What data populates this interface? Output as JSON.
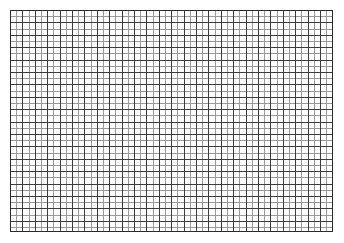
{
  "page": {
    "width": 344,
    "height": 243,
    "background_color": "#ffffff"
  },
  "graph_paper": {
    "name": "graph-paper-grid",
    "description": "Blank square-ruled graph paper sheet",
    "left": 10,
    "top": 10,
    "width": 323,
    "height": 222,
    "paper_color": "#ffffff",
    "minor_line_color": "#9a9a9a",
    "major_line_color": "#3c3c3c",
    "border_color": "#2b2b2b",
    "minor_cell_px": 6.2,
    "major_every_n_cells": 2,
    "minor_line_width_px": 1,
    "major_line_width_px": 1,
    "border_width_px": 1,
    "columns_minor": 52,
    "rows_minor": 36,
    "columns_major": 26,
    "rows_major": 18,
    "labels": [],
    "annotations": []
  }
}
